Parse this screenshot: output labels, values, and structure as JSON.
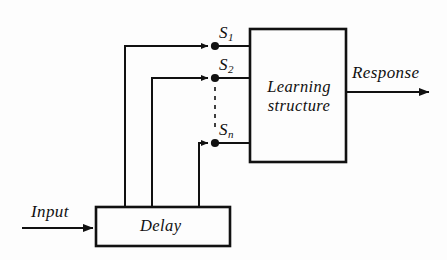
{
  "diagram": {
    "type": "block-diagram",
    "background_color": "#fdfdfd",
    "line_color": "#111111",
    "blocks": [
      {
        "id": "learning-structure",
        "label_line1": "Learning",
        "label_line2": "structure",
        "x": 250,
        "y": 29,
        "width": 96,
        "height": 133
      },
      {
        "id": "delay",
        "label": "Delay",
        "x": 96,
        "y": 207,
        "width": 134,
        "height": 39
      }
    ],
    "signals": [
      {
        "id": "s1",
        "label_base": "S",
        "label_sub": "1",
        "y": 46,
        "tap_x": 215,
        "riser_x": 125
      },
      {
        "id": "s2",
        "label_base": "S",
        "label_sub": "2",
        "y": 78,
        "tap_x": 215,
        "riser_x": 152
      },
      {
        "id": "sn",
        "label_base": "S",
        "label_sub": "n",
        "y": 143,
        "tap_x": 215,
        "riser_x": 199
      }
    ],
    "io": {
      "input_label": "Input",
      "response_label": "Response"
    },
    "ellipsis": {
      "style": "dashed-vertical",
      "x": 215,
      "y_start": 86,
      "y_end": 130
    }
  }
}
